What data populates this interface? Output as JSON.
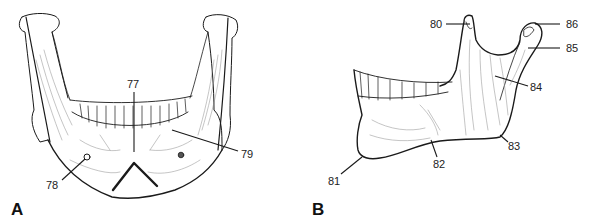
{
  "figure": {
    "panels": [
      {
        "id": "A",
        "label": "A",
        "view": "anterior",
        "callouts": [
          {
            "number": "77"
          },
          {
            "number": "78"
          },
          {
            "number": "79"
          }
        ]
      },
      {
        "id": "B",
        "label": "B",
        "view": "lateral",
        "callouts": [
          {
            "number": "80"
          },
          {
            "number": "81"
          },
          {
            "number": "82"
          },
          {
            "number": "83"
          },
          {
            "number": "84"
          },
          {
            "number": "85"
          },
          {
            "number": "86"
          }
        ]
      }
    ],
    "colors": {
      "ink": "#1a1a1a",
      "shading": "#8a8a8a",
      "background": "#ffffff"
    }
  }
}
